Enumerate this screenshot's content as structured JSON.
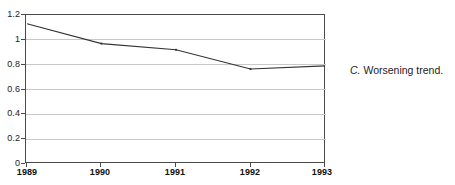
{
  "figure": {
    "caption_letter": "C.",
    "caption_text": "Worsening trend."
  },
  "chart_data": {
    "type": "line",
    "title": "",
    "xlabel": "",
    "ylabel": "",
    "categories": [
      "1989",
      "1990",
      "1991",
      "1992",
      "1993"
    ],
    "x": [
      1989,
      1990,
      1991,
      1992,
      1993
    ],
    "values": [
      1.13,
      0.97,
      0.92,
      0.765,
      0.79
    ],
    "series": [
      {
        "name": "trend",
        "values": [
          1.13,
          0.97,
          0.92,
          0.765,
          0.79
        ],
        "color": "#333333",
        "markers": true
      }
    ],
    "ylim": [
      0,
      1.2
    ],
    "xlim": [
      1989,
      1993
    ],
    "y_ticks": [
      0,
      0.2,
      0.4,
      0.6,
      0.8,
      1,
      1.2
    ],
    "y_tick_labels": [
      "0",
      "0.2",
      "0.4",
      "0.6",
      "0.8",
      "1",
      "1.2"
    ],
    "x_ticks": [
      1989,
      1990,
      1991,
      1992,
      1993
    ],
    "x_tick_labels": [
      "1989",
      "1990",
      "1991",
      "1992",
      "1993"
    ],
    "grid": true,
    "grid_axis": "y",
    "grid_color": "#c8c8c8",
    "legend": false,
    "legend_position": "none",
    "line_color": "#333333",
    "frame_color": "#4a4a4a",
    "background": "#ffffff"
  }
}
